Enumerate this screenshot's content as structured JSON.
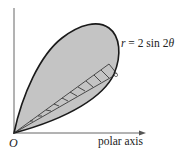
{
  "figure": {
    "curve_label_var": "r",
    "curve_label_rest": " = 2 sin 2",
    "curve_label_theta": "θ",
    "origin_label": "O",
    "axis_label": "polar axis"
  },
  "colors": {
    "fill": "#c4c4c4",
    "stroke": "#1a1a1a",
    "axis": "#555555"
  }
}
